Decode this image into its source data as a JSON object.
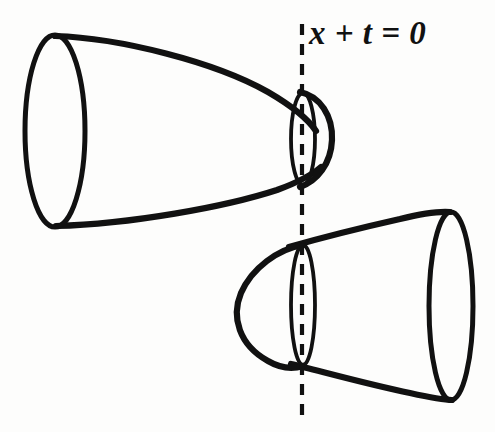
{
  "figure": {
    "background_color": "#fdfdfc",
    "ink_color": "#111111",
    "width": 495,
    "height": 432,
    "annotations": [
      {
        "name": "plane-equation-label",
        "text": "x + t = 0",
        "x": 309,
        "y": 17,
        "style": "italic-serif-bold"
      }
    ],
    "axis": {
      "name": "dashed-vertical-line",
      "label": "x + t = 0",
      "x": 302,
      "y_top": 24,
      "y_bottom": 416,
      "dash_pattern": "11 9",
      "color": "#111111"
    },
    "shapes": [
      {
        "name": "upper-cone",
        "description": "Truncated cone / horn opening to the left, nose tangent to the dashed plane on the right",
        "big_end": {
          "side": "left",
          "center_x": 55,
          "center_y": 131,
          "rx": 30,
          "ry": 96
        },
        "small_end": {
          "side": "right",
          "center_x": 303,
          "center_y": 139,
          "rx": 12,
          "ry": 46
        },
        "nose_tip_x": 332
      },
      {
        "name": "lower-cone",
        "description": "Truncated cone / horn opening to the right, nose tangent to the dashed plane on the left",
        "big_end": {
          "side": "right",
          "center_x": 451,
          "center_y": 306,
          "rx": 22,
          "ry": 94
        },
        "small_end": {
          "side": "left",
          "center_x": 303,
          "center_y": 305,
          "rx": 12,
          "ry": 60
        },
        "nose_tip_x": 237
      }
    ]
  }
}
